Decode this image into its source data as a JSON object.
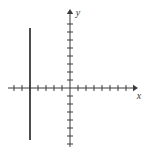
{
  "figure": {
    "title": "",
    "background_color": "#ffffff",
    "ink_color": "#3a3a3a",
    "width": 150,
    "height": 153
  },
  "axes": {
    "x": {
      "label": "x",
      "label_position": {
        "x": 139,
        "y": 99
      },
      "line": {
        "x1": 8,
        "y1": 88,
        "x2": 133,
        "y2": 88
      },
      "arrow": "right",
      "tick_spacing_px": 8,
      "tick_half_len_px": 3,
      "ticks_left_of_origin": 7,
      "ticks_right_of_origin": 7
    },
    "y": {
      "label": "y",
      "label_position": {
        "x": 78,
        "y": 16
      },
      "line": {
        "x1": 70,
        "y1": 14,
        "x2": 70,
        "y2": 147
      },
      "arrow": "up",
      "tick_spacing_px": 8,
      "tick_half_len_px": 3,
      "ticks_above_origin": 8,
      "ticks_below_origin": 7
    },
    "origin": {
      "x": 70,
      "y": 88
    }
  },
  "chart_data": {
    "type": "line",
    "title": "",
    "xlabel": "x",
    "ylabel": "y",
    "grid": false,
    "legend": null,
    "xlim": [
      -7.75,
      7.875
    ],
    "ylim": [
      -7.375,
      9.25
    ],
    "tick_unit_px": 8,
    "annotations": [],
    "series": [
      {
        "name": "vertical-line",
        "equation": "x = -5",
        "type": "line",
        "stroke_color": "#3a3a3a",
        "stroke_width": 1.8,
        "x": [
          -5,
          -5
        ],
        "y": [
          7.5,
          -6.5
        ],
        "pixel_endpoints": {
          "x1": 30,
          "y1": 28,
          "x2": 30,
          "y2": 140
        }
      }
    ]
  }
}
